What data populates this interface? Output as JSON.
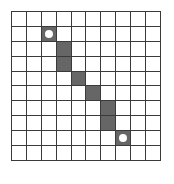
{
  "figure": {
    "name": "grid-path-puzzle",
    "colors": {
      "background": "#ffffff",
      "grid_line": "#3a3a3a",
      "cell_empty": "#ffffff",
      "cell_filled": "#666666",
      "marker_dot": "#ffffff"
    }
  },
  "grid": {
    "rows": 10,
    "columns": 10,
    "cell_size_px": 15,
    "origin_x_px": 11,
    "origin_y_px": 11,
    "filled_cells": [
      {
        "row": 1,
        "col": 2,
        "marker": "dot"
      },
      {
        "row": 2,
        "col": 3,
        "marker": "none"
      },
      {
        "row": 3,
        "col": 3,
        "marker": "none"
      },
      {
        "row": 4,
        "col": 4,
        "marker": "none"
      },
      {
        "row": 5,
        "col": 5,
        "marker": "none"
      },
      {
        "row": 6,
        "col": 6,
        "marker": "none"
      },
      {
        "row": 7,
        "col": 6,
        "marker": "none"
      },
      {
        "row": 8,
        "col": 7,
        "marker": "dot"
      }
    ],
    "markers": [
      {
        "row": 1,
        "col": 2,
        "name": "start-dot"
      },
      {
        "row": 8,
        "col": 7,
        "name": "end-dot"
      }
    ]
  },
  "chart_data": {
    "type": "heatmap",
    "title": "",
    "xlabel": "",
    "ylabel": "",
    "categories": [
      "0",
      "1",
      "2",
      "3",
      "4",
      "5",
      "6",
      "7",
      "8",
      "9"
    ],
    "rows": [
      "0",
      "1",
      "2",
      "3",
      "4",
      "5",
      "6",
      "7",
      "8",
      "9"
    ],
    "values": [
      [
        0,
        0,
        0,
        0,
        0,
        0,
        0,
        0,
        0,
        0
      ],
      [
        0,
        0,
        1,
        0,
        0,
        0,
        0,
        0,
        0,
        0
      ],
      [
        0,
        0,
        0,
        1,
        0,
        0,
        0,
        0,
        0,
        0
      ],
      [
        0,
        0,
        0,
        1,
        0,
        0,
        0,
        0,
        0,
        0
      ],
      [
        0,
        0,
        0,
        0,
        1,
        0,
        0,
        0,
        0,
        0
      ],
      [
        0,
        0,
        0,
        0,
        0,
        1,
        0,
        0,
        0,
        0
      ],
      [
        0,
        0,
        0,
        0,
        0,
        0,
        1,
        0,
        0,
        0
      ],
      [
        0,
        0,
        0,
        0,
        0,
        0,
        1,
        0,
        0,
        0
      ],
      [
        0,
        0,
        0,
        0,
        0,
        0,
        0,
        1,
        0,
        0
      ],
      [
        0,
        0,
        0,
        0,
        0,
        0,
        0,
        0,
        0,
        0
      ]
    ],
    "grid": true,
    "legend": []
  }
}
